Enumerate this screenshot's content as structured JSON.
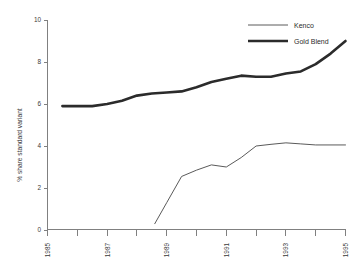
{
  "chart_data": {
    "type": "line",
    "title": "",
    "subtitle": "",
    "xlabel": "",
    "ylabel": "% share standard variant",
    "xlim": [
      1985,
      1995
    ],
    "ylim": [
      0,
      10
    ],
    "grid": false,
    "legend_position": "top-right",
    "x_ticks": [
      1985,
      1986,
      1987,
      1988,
      1989,
      1990,
      1991,
      1992,
      1993,
      1994,
      1995
    ],
    "x_tick_labels": [
      "1985",
      "",
      "1987",
      "",
      "1989",
      "",
      "1991",
      "",
      "1993",
      "",
      "1995"
    ],
    "y_ticks": [
      0,
      2,
      4,
      6,
      8,
      10
    ],
    "y_tick_labels": [
      "0",
      "2",
      "4",
      "6",
      "8",
      "10"
    ],
    "series": [
      {
        "name": "Kenco",
        "color": "#5a5a5a",
        "line_width": 1,
        "x": [
          1988.6,
          1989.0,
          1989.5,
          1990.0,
          1990.5,
          1991.0,
          1991.5,
          1992.0,
          1992.5,
          1993.0,
          1993.5,
          1994.0,
          1995.0
        ],
        "values": [
          0.3,
          1.3,
          2.55,
          2.85,
          3.1,
          3.0,
          3.45,
          4.0,
          4.08,
          4.15,
          4.1,
          4.05,
          4.05
        ]
      },
      {
        "name": "Gold Blend",
        "color": "#2b2b2b",
        "line_width": 2.6,
        "x": [
          1985.5,
          1986.0,
          1986.5,
          1987.0,
          1987.5,
          1988.0,
          1988.5,
          1989.0,
          1989.5,
          1990.0,
          1990.5,
          1991.0,
          1991.5,
          1992.0,
          1992.5,
          1993.0,
          1993.5,
          1994.0,
          1994.5,
          1995.0
        ],
        "values": [
          5.9,
          5.9,
          5.9,
          6.0,
          6.15,
          6.4,
          6.5,
          6.55,
          6.6,
          6.8,
          7.05,
          7.2,
          7.35,
          7.3,
          7.3,
          7.45,
          7.55,
          7.9,
          8.4,
          9.0
        ]
      }
    ],
    "legend_entries": [
      {
        "label": "Kenco",
        "color": "#5a5a5a",
        "style": "thin-line"
      },
      {
        "label": "Gold Blend",
        "color": "#2b2b2b",
        "style": "thick-line"
      }
    ]
  },
  "colors": {
    "background": "#ffffff",
    "axis": "#808080",
    "text": "#3a3a3a",
    "kenco": "#5a5a5a",
    "gold_blend": "#2b2b2b"
  }
}
